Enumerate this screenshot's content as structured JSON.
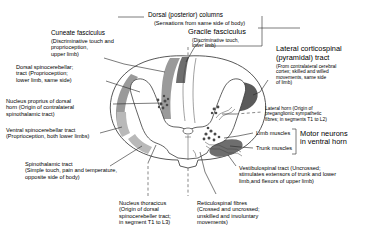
{
  "figure": {
    "type": "anatomical-diagram"
  },
  "labels": {
    "dorsal_columns": {
      "title": "Dorsal (posterior) columns",
      "sub": "(Sensations from same side of body)"
    },
    "cuneate_fasciculus": {
      "title": "Cuneate fasciculus",
      "sub": "(Discriminative touch and\nproprioception,\nupper limb)"
    },
    "gracile_fasciculus": {
      "title": "Gracile fasciculus",
      "sub": "(Discriminative touch,\nlower limb)"
    },
    "dorsal_spinocerebellar": {
      "text": "Dorsal spinocerebellar;\ntract (Proprioception;\nlower limb, same side)"
    },
    "nucleus_proprius": {
      "text": "Nucleus proprius of dorsal\nhorn (Origin of contralateral\nspinothalamic tract)"
    },
    "ventral_spinocerebellar": {
      "text": "Ventral spinocerebellar tract\n(Proprioception, both lower limbs)"
    },
    "spinothalamic": {
      "text": "Spinothalamic tract\n(Simple touch, pain and temperature,\nopposite side of body)"
    },
    "nucleus_thoracicus": {
      "text": "Nucleus thoracicus\n(Origin of dorsal\nspinocerebeller tract;\nin segment T1 to L3)"
    },
    "reticulospinal": {
      "text": "Reticulospinal fibres\n(Crossed and uncrossed;\nunskilled and involuntary\nmovements)"
    },
    "lateral_corticospinal": {
      "title": "Lateral corticospinal",
      "title2": "(pyramidal) tract",
      "sub": "(From contralateral cerebral\ncortex; skilled and willed\nmovements, same side\nof limb)"
    },
    "lateral_horn": {
      "text": "Lateral horn (Origin of\npreganglionic sympathetic\nfibres; in segments T1 to L2)"
    },
    "limb_muscles": {
      "text": "Limb muscles"
    },
    "trunk_muscles": {
      "text": "Trunk muscles"
    },
    "motor_neurons": {
      "text": "Motor neurons\nin ventral horn"
    },
    "vestibulospinal": {
      "text": "Vestibulospinal tract (Uncrossed;\nstimulates extensors of trunk and lower\nlimb,and flexors of upper limb)"
    }
  },
  "colors": {
    "ink": "#000000",
    "outline": "#3a3a3a",
    "tract_light": "#b9b9b9",
    "tract_mid": "#9a9a9a",
    "tract_dark": "#6e6e6e",
    "tract_darkest": "#5a5a5a",
    "background": "#ffffff"
  }
}
